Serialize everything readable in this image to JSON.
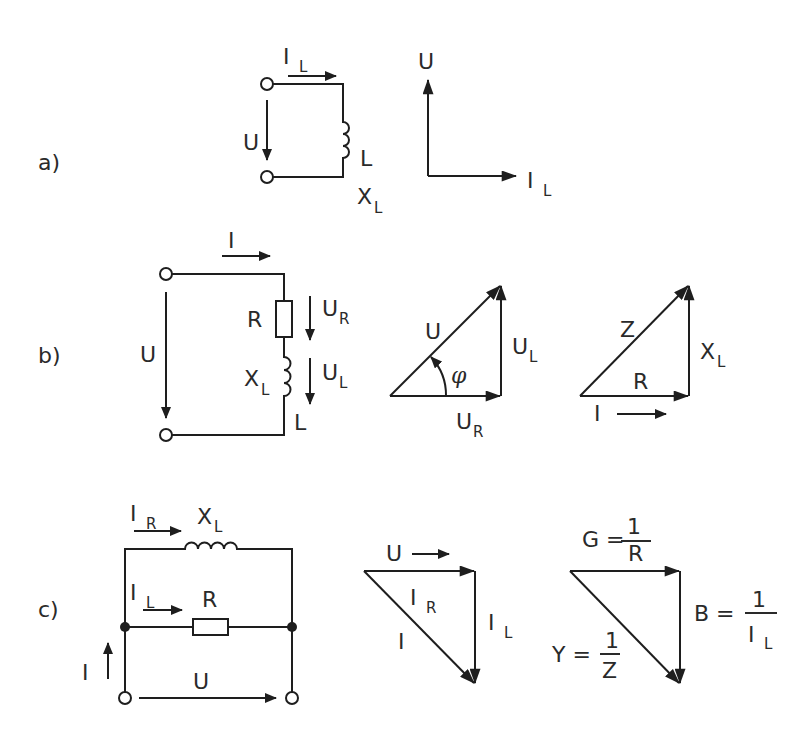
{
  "figure": {
    "sections": [
      {
        "id": "a",
        "label": "a)",
        "title": "Ideal inductor",
        "circuit": {
          "components": [
            "L"
          ],
          "labels": {
            "current": "I",
            "current_sub": "L",
            "voltage": "U",
            "inductor": "L",
            "reactance": "X",
            "reactance_sub": "L"
          }
        },
        "phasor": {
          "vectors": [
            {
              "name": "U",
              "direction": "up"
            },
            {
              "name": "I",
              "sub": "L",
              "direction": "right"
            }
          ]
        }
      },
      {
        "id": "b",
        "label": "b)",
        "title": "Series R-L circuit",
        "circuit": {
          "components": [
            "R",
            "L"
          ],
          "labels": {
            "current": "I",
            "voltage": "U",
            "resistor": "R",
            "ur": "U",
            "ur_sub": "R",
            "ul": "U",
            "ul_sub": "L",
            "reactance": "X",
            "reactance_sub": "L",
            "inductor": "L"
          }
        },
        "voltage_triangle": {
          "hyp": "U",
          "vertical": "U",
          "vertical_sub": "L",
          "base": "U",
          "base_sub": "R",
          "angle": "φ"
        },
        "impedance_triangle": {
          "hyp": "Z",
          "vertical": "X",
          "vertical_sub": "L",
          "base": "R",
          "reference": "I"
        }
      },
      {
        "id": "c",
        "label": "c)",
        "title": "Parallel R-L circuit",
        "circuit": {
          "components": [
            "X_L",
            "R"
          ],
          "labels": {
            "ir": "I",
            "ir_sub": "R",
            "xl": "X",
            "xl_sub": "L",
            "il": "I",
            "il_sub": "L",
            "resistor": "R",
            "current": "I",
            "voltage": "U"
          }
        },
        "current_triangle": {
          "reference": "U",
          "base": "I",
          "base_sub": "R",
          "vertical": "I",
          "vertical_sub": "L",
          "hyp": "I"
        },
        "admittance_triangle": {
          "g_lhs": "G =",
          "g_num": "1",
          "g_den": "R",
          "b_lhs": "B =",
          "b_num": "1",
          "b_den": "I",
          "b_den_sub": "L",
          "y_lhs": "Y =",
          "y_num": "1",
          "y_den": "Z"
        }
      }
    ]
  }
}
